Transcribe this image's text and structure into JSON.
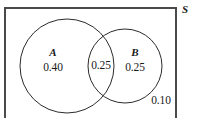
{
  "figure": {
    "type": "venn-diagram",
    "background_color": "#ffffff",
    "stroke_color": "#2b2b2b",
    "text_color": "#1a1a1a"
  },
  "universe": {
    "label": "S",
    "outside_value": "0.10",
    "rect": {
      "x": 5,
      "y": 8,
      "width": 171,
      "height": 114
    },
    "border_color": "#4a4a4a",
    "border_width": 2
  },
  "sets": [
    {
      "name": "A",
      "label": "A",
      "value": "0.40",
      "cx": 67,
      "cy": 66,
      "r": 47,
      "label_x": 53,
      "label_y": 52,
      "value_x": 53,
      "value_y": 68
    },
    {
      "name": "B",
      "label": "B",
      "value": "0.25",
      "cx": 125,
      "cy": 66,
      "r": 37,
      "label_x": 135,
      "label_y": 52,
      "value_x": 135,
      "value_y": 68
    }
  ],
  "intersection": {
    "label": "A and B",
    "value": "0.25",
    "x": 101,
    "y": 66
  },
  "chart_data": {
    "type": "venn",
    "title": "",
    "sets": [
      "A",
      "B"
    ],
    "universe_label": "S",
    "regions": [
      {
        "region": "A only",
        "label": "A",
        "value": 0.4,
        "display": "0.40"
      },
      {
        "region": "A and B",
        "label": "A ∩ B",
        "value": 0.25,
        "display": "0.25"
      },
      {
        "region": "B only",
        "label": "B",
        "value": 0.25,
        "display": "0.25"
      },
      {
        "region": "neither A nor B",
        "label": "S \\ (A ∪ B)",
        "value": 0.1,
        "display": "0.10"
      }
    ],
    "total": 1.0
  }
}
